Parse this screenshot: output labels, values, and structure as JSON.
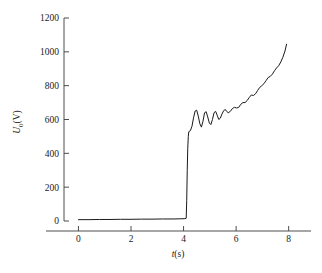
{
  "figure": {
    "background_color": "#ffffff",
    "line_color": "#1a1a1a",
    "axis_color": "#3a3a3a"
  },
  "axes": {
    "x": {
      "title_var": "t",
      "title_unit": "(s)",
      "title_full": "t(s)",
      "ticks": [
        "0",
        "2",
        "4",
        "6",
        "8"
      ],
      "values": [
        0,
        2,
        4,
        6,
        8
      ],
      "min": -0.55,
      "max": 8.85
    },
    "y": {
      "title_var": "U",
      "title_sub": "0",
      "title_unit": "(V)",
      "title_full": "U0(V)",
      "ticks": [
        "0",
        "200",
        "400",
        "600",
        "800",
        "1000",
        "1200"
      ],
      "values": [
        0,
        200,
        400,
        600,
        800,
        1000,
        1200
      ],
      "min": 0,
      "max": 1200
    }
  },
  "chart_data": {
    "type": "line",
    "title": "",
    "subtitle": "",
    "xlabel": "t(s)",
    "ylabel": "U0(V)",
    "xlim": [
      -0.55,
      8.85
    ],
    "ylim": [
      0,
      1200
    ],
    "grid": false,
    "legend": null,
    "legend_position": "none",
    "series": [
      {
        "name": "U0",
        "color": "#1a1a1a",
        "line_width": 1.0,
        "x": [
          0.0,
          0.4,
          0.8,
          1.2,
          1.6,
          2.0,
          2.4,
          2.8,
          3.2,
          3.6,
          3.9,
          4.05,
          4.1,
          4.12,
          4.14,
          4.16,
          4.18,
          4.2,
          4.26,
          4.32,
          4.38,
          4.44,
          4.5,
          4.56,
          4.62,
          4.68,
          4.74,
          4.8,
          4.86,
          4.92,
          4.98,
          5.04,
          5.1,
          5.16,
          5.22,
          5.28,
          5.34,
          5.4,
          5.46,
          5.52,
          5.58,
          5.64,
          5.7,
          5.78,
          5.86,
          5.94,
          6.02,
          6.1,
          6.18,
          6.26,
          6.34,
          6.42,
          6.5,
          6.58,
          6.66,
          6.74,
          6.82,
          6.9,
          6.98,
          7.06,
          7.14,
          7.22,
          7.3,
          7.38,
          7.46,
          7.54,
          7.62,
          7.7,
          7.78,
          7.86,
          7.92
        ],
        "y": [
          8,
          8,
          9,
          9,
          10,
          10,
          11,
          11,
          12,
          12,
          13,
          14,
          16,
          120,
          300,
          430,
          500,
          528,
          534,
          560,
          610,
          650,
          655,
          620,
          575,
          555,
          590,
          640,
          646,
          615,
          580,
          570,
          600,
          640,
          648,
          625,
          600,
          608,
          632,
          650,
          660,
          648,
          640,
          648,
          665,
          672,
          668,
          672,
          690,
          700,
          700,
          712,
          730,
          745,
          742,
          752,
          772,
          790,
          800,
          812,
          830,
          848,
          855,
          868,
          888,
          905,
          918,
          940,
          968,
          1005,
          1045
        ]
      }
    ],
    "annotations": []
  }
}
